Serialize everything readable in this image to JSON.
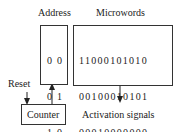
{
  "labels": {
    "address": "Address",
    "microwords": "Microwords",
    "reset": "Reset",
    "counter": "Counter",
    "activation": "Activation signals"
  },
  "address_table": {
    "rows": [
      "0 0",
      "0 1",
      "1 0",
      "1 1"
    ]
  },
  "microword_table": {
    "rows": [
      "11000101010",
      "00100010101",
      "00010000000",
      "00001000000"
    ]
  }
}
